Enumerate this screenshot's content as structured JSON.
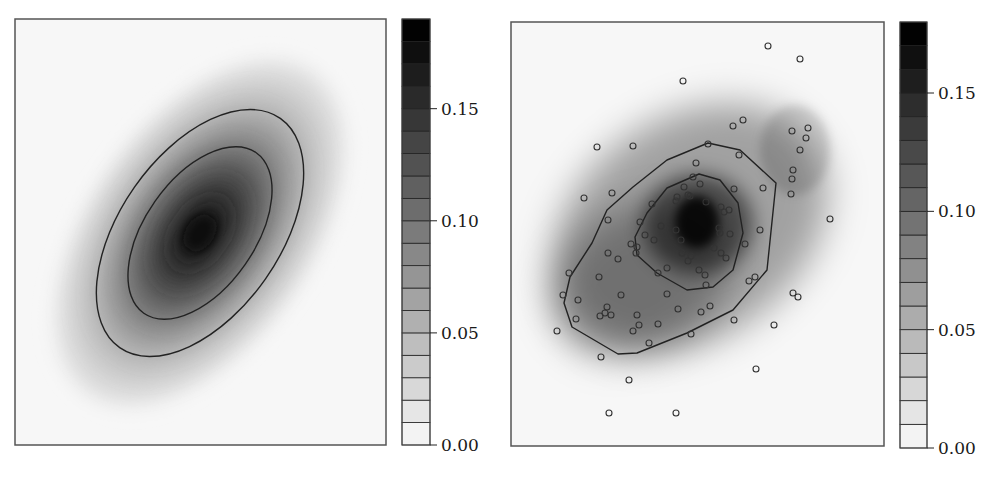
{
  "figure": {
    "panels": 2,
    "background": "#ffffff",
    "frame_color": "#555555",
    "contour_color": "#222222",
    "point_stroke": "#333333"
  },
  "chart_data": [
    {
      "type": "heatmap",
      "title": "",
      "description": "Smooth bivariate Gaussian density (true density), grayscale with two contour lines",
      "xlabel": "",
      "ylabel": "",
      "grid": false,
      "plot_box": {
        "x": 15,
        "y": 19,
        "w": 371,
        "h": 426
      },
      "density": {
        "shape": "ellipse",
        "center_px": [
          200,
          233
        ],
        "rotation_deg": -35,
        "peak_value": 0.19,
        "sigma_major_px": 75,
        "sigma_minor_px": 42
      },
      "contours": [
        {
          "level": "outer",
          "shape": "ellipse",
          "cx": 200,
          "cy": 233,
          "rx": 80,
          "ry": 140,
          "rotation_deg": 35
        },
        {
          "level": "inner",
          "shape": "ellipse",
          "cx": 200,
          "cy": 233,
          "rx": 55,
          "ry": 98,
          "rotation_deg": 35
        }
      ],
      "colorbar": {
        "box": {
          "x": 402,
          "y": 19,
          "w": 28,
          "h": 426
        },
        "vmin": 0.0,
        "vmax": 0.19,
        "band_step": 0.01,
        "ticks": [
          0.0,
          0.05,
          0.1,
          0.15
        ],
        "tick_labels": [
          "0.00",
          "0.05",
          "0.10",
          "0.15"
        ],
        "cmap": "gray_r"
      }
    },
    {
      "type": "heatmap",
      "title": "",
      "description": "Kernel density estimate of sampled points (grayscale) with two contour lines and scatter of sample points",
      "xlabel": "",
      "ylabel": "",
      "grid": false,
      "plot_box": {
        "x": 511,
        "y": 22,
        "w": 373,
        "h": 424
      },
      "density_blobs": [
        {
          "cx": 690,
          "cy": 228,
          "rx": 150,
          "ry": 110,
          "rotation_deg": -35,
          "alpha": 0.35
        },
        {
          "cx": 640,
          "cy": 280,
          "rx": 95,
          "ry": 70,
          "rotation_deg": -30,
          "alpha": 0.3
        },
        {
          "cx": 698,
          "cy": 224,
          "rx": 55,
          "ry": 50,
          "rotation_deg": 0,
          "alpha": 0.55
        },
        {
          "cx": 697,
          "cy": 222,
          "rx": 22,
          "ry": 26,
          "rotation_deg": 0,
          "alpha": 0.85
        },
        {
          "cx": 795,
          "cy": 150,
          "rx": 35,
          "ry": 45,
          "rotation_deg": 0,
          "alpha": 0.15
        }
      ],
      "contours": [
        {
          "level": "outer",
          "points": [
            [
              708,
              143
            ],
            [
              740,
              150
            ],
            [
              776,
              183
            ],
            [
              767,
              270
            ],
            [
              733,
              310
            ],
            [
              687,
              333
            ],
            [
              637,
              353
            ],
            [
              618,
              354
            ],
            [
              572,
              327
            ],
            [
              564,
              303
            ],
            [
              570,
              277
            ],
            [
              592,
              243
            ],
            [
              607,
              210
            ],
            [
              633,
              187
            ],
            [
              667,
              160
            ]
          ]
        },
        {
          "level": "inner",
          "points": [
            [
              699,
              174
            ],
            [
              720,
              180
            ],
            [
              738,
              203
            ],
            [
              743,
              233
            ],
            [
              733,
              270
            ],
            [
              713,
              287
            ],
            [
              687,
              290
            ],
            [
              657,
              273
            ],
            [
              637,
              255
            ],
            [
              635,
              237
            ],
            [
              647,
              213
            ],
            [
              667,
              188
            ]
          ]
        }
      ],
      "scatter_px": [
        [
          768,
          46
        ],
        [
          800,
          59
        ],
        [
          683,
          81
        ],
        [
          733,
          126
        ],
        [
          743,
          120
        ],
        [
          792,
          131
        ],
        [
          808,
          128
        ],
        [
          806,
          138
        ],
        [
          800,
          150
        ],
        [
          597,
          147
        ],
        [
          633,
          146
        ],
        [
          708,
          144
        ],
        [
          739,
          155
        ],
        [
          696,
          163
        ],
        [
          793,
          170
        ],
        [
          792,
          179
        ],
        [
          791,
          194
        ],
        [
          584,
          198
        ],
        [
          612,
          193
        ],
        [
          693,
          177
        ],
        [
          700,
          184
        ],
        [
          734,
          189
        ],
        [
          763,
          188
        ],
        [
          684,
          187
        ],
        [
          688,
          195
        ],
        [
          690,
          196
        ],
        [
          677,
          197
        ],
        [
          676,
          201
        ],
        [
          706,
          202
        ],
        [
          652,
          204
        ],
        [
          721,
          207
        ],
        [
          729,
          210
        ],
        [
          724,
          212
        ],
        [
          608,
          220
        ],
        [
          640,
          222
        ],
        [
          661,
          226
        ],
        [
          830,
          219
        ],
        [
          676,
          230
        ],
        [
          719,
          228
        ],
        [
          720,
          233
        ],
        [
          730,
          234
        ],
        [
          760,
          230
        ],
        [
          645,
          235
        ],
        [
          654,
          240
        ],
        [
          681,
          240
        ],
        [
          631,
          244
        ],
        [
          637,
          247
        ],
        [
          745,
          244
        ],
        [
          714,
          248
        ],
        [
          608,
          253
        ],
        [
          636,
          253
        ],
        [
          682,
          253
        ],
        [
          691,
          256
        ],
        [
          721,
          253
        ],
        [
          726,
          258
        ],
        [
          618,
          259
        ],
        [
          688,
          261
        ],
        [
          569,
          273
        ],
        [
          667,
          268
        ],
        [
          658,
          273
        ],
        [
          699,
          270
        ],
        [
          705,
          275
        ],
        [
          599,
          277
        ],
        [
          749,
          281
        ],
        [
          755,
          277
        ],
        [
          706,
          285
        ],
        [
          563,
          295
        ],
        [
          667,
          294
        ],
        [
          621,
          295
        ],
        [
          793,
          293
        ],
        [
          798,
          297
        ],
        [
          578,
          300
        ],
        [
          607,
          307
        ],
        [
          605,
          313
        ],
        [
          600,
          316
        ],
        [
          611,
          315
        ],
        [
          637,
          315
        ],
        [
          678,
          309
        ],
        [
          701,
          312
        ],
        [
          710,
          306
        ],
        [
          576,
          319
        ],
        [
          734,
          320
        ],
        [
          639,
          325
        ],
        [
          658,
          324
        ],
        [
          774,
          325
        ],
        [
          557,
          331
        ],
        [
          633,
          331
        ],
        [
          691,
          334
        ],
        [
          649,
          343
        ],
        [
          601,
          357
        ],
        [
          756,
          369
        ],
        [
          629,
          380
        ],
        [
          609,
          413
        ],
        [
          676,
          413
        ]
      ],
      "colorbar": {
        "box": {
          "x": 900,
          "y": 22,
          "w": 27,
          "h": 426
        },
        "vmin": 0.0,
        "vmax": 0.18,
        "band_step": 0.01,
        "ticks": [
          0.0,
          0.05,
          0.1,
          0.15
        ],
        "tick_labels": [
          "0.00",
          "0.05",
          "0.10",
          "0.15"
        ],
        "cmap": "gray_r"
      }
    }
  ]
}
